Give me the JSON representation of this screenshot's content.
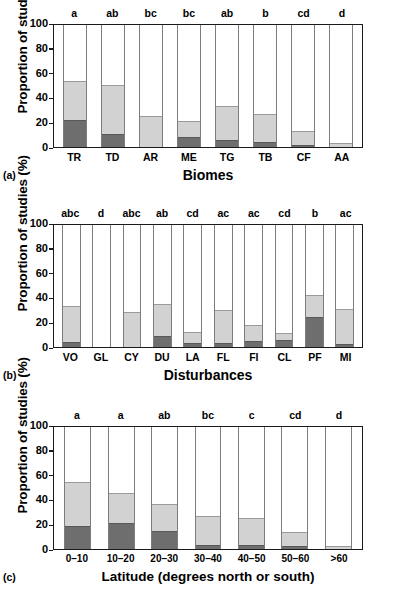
{
  "figure": {
    "ylabel": "Proportion of studies (%)",
    "yticks": [
      "0",
      "20",
      "40",
      "60",
      "80",
      "100"
    ],
    "ylim": [
      0,
      100
    ]
  },
  "panels": [
    {
      "tag": "(a)",
      "xlabel": "Biomes",
      "ylabel": "Proportion of studies (%)",
      "categories": [
        "TR",
        "TD",
        "AR",
        "ME",
        "TG",
        "TB",
        "CF",
        "AA"
      ],
      "significance": [
        "a",
        "ab",
        "bc",
        "bc",
        "ab",
        "b",
        "cd",
        "d"
      ],
      "dark": [
        22.4,
        10.3,
        0.0,
        8.4,
        5.5,
        4.5,
        1.6,
        0.0
      ],
      "light": [
        31.4,
        40.5,
        25.3,
        13.2,
        28.3,
        22.9,
        11.2,
        3.5
      ],
      "total": [
        53.8,
        50.8,
        25.3,
        21.6,
        33.8,
        27.4,
        12.8,
        3.5
      ]
    },
    {
      "tag": "(b)",
      "xlabel": "Disturbances",
      "ylabel": "Proportion of studies (%)",
      "categories": [
        "VO",
        "GL",
        "CY",
        "DU",
        "LA",
        "FL",
        "FI",
        "CL",
        "PF",
        "MI"
      ],
      "significance": [
        "abc",
        "d",
        "abc",
        "ab",
        "cd",
        "ac",
        "ac",
        "cd",
        "b",
        "ac"
      ],
      "dark": [
        4.0,
        0.0,
        0.0,
        9.0,
        3.4,
        3.2,
        5.0,
        6.0,
        24.5,
        2.7
      ],
      "light": [
        29.4,
        0.0,
        29.0,
        26.0,
        8.6,
        27.3,
        13.0,
        5.2,
        18.3,
        28.5
      ],
      "total": [
        33.4,
        0.0,
        29.0,
        35.0,
        12.0,
        30.5,
        18.0,
        11.2,
        42.8,
        31.2
      ]
    },
    {
      "tag": "(c)",
      "xlabel": "Latitude (degrees north or south)",
      "ylabel": "Proportion of studies (%)",
      "categories": [
        "0–10",
        "10–20",
        "20–30",
        "30–40",
        "40–50",
        "50–60",
        ">60"
      ],
      "significance": [
        "a",
        "a",
        "ab",
        "bc",
        "c",
        "cd",
        "d"
      ],
      "dark": [
        18.6,
        21.0,
        14.5,
        3.6,
        3.6,
        2.4,
        0.0
      ],
      "light": [
        36.0,
        25.2,
        22.5,
        23.1,
        22.1,
        11.5,
        2.8
      ],
      "total": [
        54.6,
        46.2,
        37.0,
        26.7,
        25.7,
        13.9,
        2.8
      ]
    }
  ],
  "chart_data": {
    "type": "bar",
    "subtype": "stacked-bar",
    "title": "",
    "ylabel": "Proportion of studies (%)",
    "ylim": [
      0,
      100
    ],
    "yticks": [
      0,
      20,
      40,
      60,
      80,
      100
    ],
    "grid": false,
    "legend": "none",
    "series": [
      {
        "name": "dark-segment",
        "color": "#6e6e6e"
      },
      {
        "name": "light-segment",
        "color": "#d2d2d2"
      }
    ],
    "panels": [
      {
        "panel": "(a)",
        "xlabel": "Biomes",
        "categories": [
          "TR",
          "TD",
          "AR",
          "ME",
          "TG",
          "TB",
          "CF",
          "AA"
        ],
        "annotations": [
          "a",
          "ab",
          "bc",
          "bc",
          "ab",
          "b",
          "cd",
          "d"
        ],
        "series": [
          {
            "name": "dark-segment",
            "values": [
              22.4,
              10.3,
              0.0,
              8.4,
              5.5,
              4.5,
              1.6,
              0.0
            ]
          },
          {
            "name": "light-segment",
            "values": [
              31.4,
              40.5,
              25.3,
              13.2,
              28.3,
              22.9,
              11.2,
              3.5
            ]
          }
        ],
        "totals": [
          53.8,
          50.8,
          25.3,
          21.6,
          33.8,
          27.4,
          12.8,
          3.5
        ]
      },
      {
        "panel": "(b)",
        "xlabel": "Disturbances",
        "categories": [
          "VO",
          "GL",
          "CY",
          "DU",
          "LA",
          "FL",
          "FI",
          "CL",
          "PF",
          "MI"
        ],
        "annotations": [
          "abc",
          "d",
          "abc",
          "ab",
          "cd",
          "ac",
          "ac",
          "cd",
          "b",
          "ac"
        ],
        "series": [
          {
            "name": "dark-segment",
            "values": [
              4.0,
              0.0,
              0.0,
              9.0,
              3.4,
              3.2,
              5.0,
              6.0,
              24.5,
              2.7
            ]
          },
          {
            "name": "light-segment",
            "values": [
              29.4,
              0.0,
              29.0,
              26.0,
              8.6,
              27.3,
              13.0,
              5.2,
              18.3,
              28.5
            ]
          }
        ],
        "totals": [
          33.4,
          0.0,
          29.0,
          35.0,
          12.0,
          30.5,
          18.0,
          11.2,
          42.8,
          31.2
        ]
      },
      {
        "panel": "(c)",
        "xlabel": "Latitude (degrees north or south)",
        "categories": [
          "0–10",
          "10–20",
          "20–30",
          "30–40",
          "40–50",
          "50–60",
          ">60"
        ],
        "annotations": [
          "a",
          "a",
          "ab",
          "bc",
          "c",
          "cd",
          "d"
        ],
        "series": [
          {
            "name": "dark-segment",
            "values": [
              18.6,
              21.0,
              14.5,
              3.6,
              3.6,
              2.4,
              0.0
            ]
          },
          {
            "name": "light-segment",
            "values": [
              36.0,
              25.2,
              22.5,
              23.1,
              22.1,
              11.5,
              2.8
            ]
          }
        ],
        "totals": [
          54.6,
          46.2,
          37.0,
          26.7,
          25.7,
          13.9,
          2.8
        ]
      }
    ]
  },
  "colors": {
    "dark_segment": "#6e6e6e",
    "light_segment": "#d2d2d2",
    "axis": "#1a1a1a",
    "bar_outline": "#7d7d7d",
    "background": "#ffffff"
  }
}
